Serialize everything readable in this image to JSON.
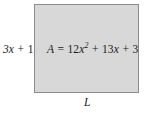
{
  "figure": {
    "type": "geometry-diagram",
    "shape": "rectangle",
    "background_color": "#ffffff",
    "rectangle": {
      "fill_color": "#d8d8d8",
      "border_color": "#8c8c8c",
      "border_width_px": 1.4,
      "x_px": 34,
      "y_px": 4,
      "width_px": 105,
      "height_px": 89
    },
    "labels": {
      "height": {
        "text": "3x + 1",
        "coefficient": "3",
        "variable": "x",
        "operator": "+",
        "constant": "1",
        "position": "left-of-rectangle",
        "meaning": "width-of-rectangle"
      },
      "area": {
        "text": "A = 12x² + 13x + 3",
        "symbol": "A",
        "equals": "=",
        "term1_coefficient": "12",
        "term1_variable": "x",
        "term1_exponent": "2",
        "operator1": "+",
        "term2_coefficient": "13",
        "term2_variable": "x",
        "operator2": "+",
        "term3_constant": "3",
        "position": "inside-rectangle",
        "meaning": "area-of-rectangle"
      },
      "length": {
        "text": "L",
        "position": "below-rectangle",
        "meaning": "length-of-rectangle"
      }
    },
    "text_color": "#1a1a1a"
  }
}
